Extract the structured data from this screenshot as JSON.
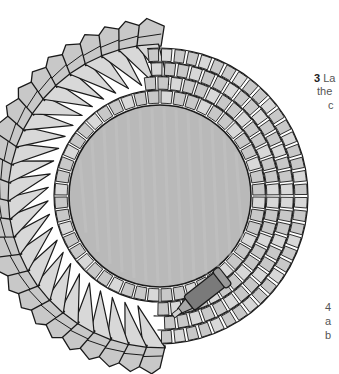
{
  "illustration": {
    "subject": "mosaic-mirror-craft-step",
    "colors": {
      "mirror": "#b9b9b9",
      "tile": "#c8c8c8",
      "tile_light": "#d8d8d8",
      "outline": "#1a1a1a",
      "tube": "#7a7a7a",
      "background": "#ffffff"
    },
    "elements": [
      "round-mirror",
      "square-tile-rings",
      "folded-tile-border",
      "adhesive-tube"
    ]
  },
  "captions": {
    "step3": {
      "number": "3",
      "line1": "La",
      "line2": "the",
      "line3": "c"
    },
    "step4": {
      "number": "4",
      "line1": "a",
      "line2": "b"
    }
  }
}
